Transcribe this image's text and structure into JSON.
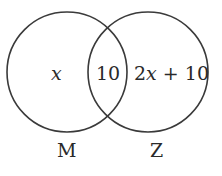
{
  "diagram": {
    "type": "venn",
    "sets": [
      {
        "name": "M",
        "only_region_label": "x"
      },
      {
        "name": "Z",
        "only_region_label": "2x + 10"
      }
    ],
    "intersection_label": "10",
    "colors": {
      "stroke": "#3a3a3a",
      "text": "#2a2a2a",
      "background": "#ffffff"
    }
  },
  "labels": {
    "m_only": "x",
    "intersection": "10",
    "z_only_coef": "2",
    "z_only_var": "x",
    "z_only_rest": " + 10",
    "set_m": "M",
    "set_z": "Z"
  }
}
